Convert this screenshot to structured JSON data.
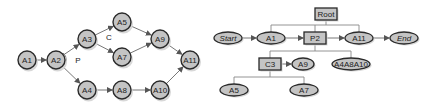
{
  "left_diagram": {
    "title": "Process graph",
    "nodes": [
      {
        "id": "A1",
        "label": "A1",
        "x": 27,
        "y": 60
      },
      {
        "id": "A2",
        "label": "A2",
        "x": 56,
        "y": 60
      },
      {
        "id": "A3",
        "label": "A3",
        "x": 87,
        "y": 39
      },
      {
        "id": "A4",
        "label": "A4",
        "x": 87,
        "y": 90
      },
      {
        "id": "A5",
        "label": "A5",
        "x": 122,
        "y": 22
      },
      {
        "id": "A7",
        "label": "A7",
        "x": 122,
        "y": 57
      },
      {
        "id": "A9",
        "label": "A9",
        "x": 160,
        "y": 39
      },
      {
        "id": "A8",
        "label": "A8",
        "x": 122,
        "y": 90
      },
      {
        "id": "A10",
        "label": "A10",
        "x": 160,
        "y": 90
      },
      {
        "id": "A11",
        "label": "A11",
        "x": 190,
        "y": 60
      }
    ],
    "edges": [
      [
        "A1",
        "A2"
      ],
      [
        "A2",
        "A3"
      ],
      [
        "A2",
        "A4"
      ],
      [
        "A3",
        "A5"
      ],
      [
        "A3",
        "A7"
      ],
      [
        "A5",
        "A9"
      ],
      [
        "A7",
        "A9"
      ],
      [
        "A9",
        "A11"
      ],
      [
        "A4",
        "A8"
      ],
      [
        "A8",
        "A10"
      ],
      [
        "A10",
        "A11"
      ]
    ],
    "annotations": [
      {
        "label": "P",
        "x": 76,
        "y": 60
      },
      {
        "label": "C",
        "x": 107,
        "y": 37
      }
    ]
  },
  "right_diagram": {
    "title": "Process tree",
    "nodes": [
      {
        "id": "Root",
        "label": "Root",
        "shape": "box",
        "x": 326,
        "y": 14,
        "w": 22,
        "h": 12,
        "italic": false
      },
      {
        "id": "Start",
        "label": "Start",
        "shape": "ellipse",
        "x": 228,
        "y": 38,
        "rx": 14,
        "ry": 6,
        "italic": true
      },
      {
        "id": "A1",
        "label": "A1",
        "shape": "ellipse",
        "x": 271,
        "y": 38,
        "rx": 14,
        "ry": 6,
        "italic": false
      },
      {
        "id": "P2",
        "label": "P2",
        "shape": "box",
        "x": 315,
        "y": 38,
        "w": 22,
        "h": 12,
        "italic": false
      },
      {
        "id": "A11",
        "label": "A11",
        "shape": "ellipse",
        "x": 359,
        "y": 38,
        "rx": 14,
        "ry": 6,
        "italic": false
      },
      {
        "id": "End",
        "label": "End",
        "shape": "ellipse",
        "x": 404,
        "y": 38,
        "rx": 14,
        "ry": 6,
        "italic": true
      },
      {
        "id": "C3",
        "label": "C3",
        "shape": "box",
        "x": 270,
        "y": 64,
        "w": 22,
        "h": 12,
        "italic": false
      },
      {
        "id": "A9",
        "label": "A9",
        "shape": "ellipse",
        "x": 303,
        "y": 64,
        "rx": 11,
        "ry": 6,
        "italic": false
      },
      {
        "id": "A4A8A10",
        "label": "A4A8A10",
        "shape": "ellipse",
        "x": 351,
        "y": 64,
        "rx": 19,
        "ry": 6,
        "italic": false
      },
      {
        "id": "A5",
        "label": "A5",
        "shape": "ellipse",
        "x": 234,
        "y": 90,
        "rx": 14,
        "ry": 6,
        "italic": false
      },
      {
        "id": "A7",
        "label": "A7",
        "shape": "ellipse",
        "x": 304,
        "y": 90,
        "rx": 14,
        "ry": 6,
        "italic": false
      }
    ],
    "tree_links": [
      {
        "parent": "Root",
        "children": [
          "A1",
          "P2",
          "A11"
        ],
        "bus_y": 25
      },
      {
        "parent": "P2",
        "children": [
          "C3",
          "A4A8A10"
        ],
        "bus_y": 51
      },
      {
        "parent": "C3",
        "children": [
          "A5",
          "A7"
        ],
        "bus_y": 77
      }
    ],
    "sequence_arrows": [
      [
        "Start",
        "A1"
      ],
      [
        "A1",
        "P2"
      ],
      [
        "P2",
        "A11"
      ],
      [
        "A11",
        "End"
      ],
      [
        "C3",
        "A9"
      ]
    ]
  },
  "colors": {
    "node_fill": "#c4c4c4",
    "node_stroke": "#2a2a2a",
    "edge": "#777777",
    "text": "#222222"
  }
}
